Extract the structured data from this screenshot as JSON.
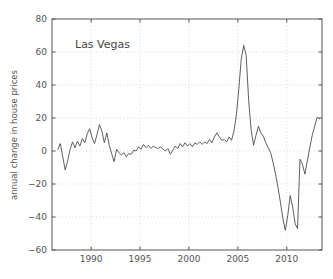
{
  "chart_data": {
    "type": "line",
    "title": "",
    "annotation": "Las Vegas",
    "xlabel": "",
    "ylabel": "annual change in house prices",
    "xlim": [
      1986.0,
      2013.6
    ],
    "ylim": [
      -60,
      80
    ],
    "xticks": [
      1990,
      1995,
      2000,
      2005,
      2010
    ],
    "xticklabels": [
      "1990",
      "1995",
      "2000",
      "2005",
      "2010"
    ],
    "yticks": [
      -60,
      -40,
      -20,
      0,
      20,
      40,
      60,
      80
    ],
    "yticklabels": [
      "-60",
      "-40",
      "-20",
      "0",
      "20",
      "40",
      "60",
      "80"
    ],
    "grid": true,
    "legend": "none",
    "line_color": "#4d4d4d",
    "series": [
      {
        "name": "Las Vegas annual change in house prices",
        "x": [
          1986.6,
          1986.85,
          1987.1,
          1987.35,
          1987.6,
          1987.85,
          1988.1,
          1988.35,
          1988.6,
          1988.85,
          1989.1,
          1989.35,
          1989.6,
          1989.85,
          1990.1,
          1990.35,
          1990.6,
          1990.85,
          1991.1,
          1991.35,
          1991.6,
          1991.85,
          1992.1,
          1992.35,
          1992.6,
          1992.85,
          1993.1,
          1993.35,
          1993.6,
          1993.85,
          1994.1,
          1994.35,
          1994.6,
          1994.85,
          1995.1,
          1995.35,
          1995.6,
          1995.85,
          1996.1,
          1996.35,
          1996.6,
          1996.85,
          1997.1,
          1997.35,
          1997.6,
          1997.85,
          1998.1,
          1998.35,
          1998.6,
          1998.85,
          1999.1,
          1999.35,
          1999.6,
          1999.85,
          2000.1,
          2000.35,
          2000.6,
          2000.85,
          2001.1,
          2001.35,
          2001.6,
          2001.85,
          2002.1,
          2002.35,
          2002.6,
          2002.85,
          2003.1,
          2003.35,
          2003.6,
          2003.85,
          2004.1,
          2004.35,
          2004.6,
          2004.85,
          2005.1,
          2005.35,
          2005.6,
          2005.85,
          2006.1,
          2006.35,
          2006.6,
          2006.85,
          2007.1,
          2007.35,
          2007.6,
          2007.85,
          2008.1,
          2008.35,
          2008.6,
          2008.85,
          2009.1,
          2009.35,
          2009.6,
          2009.85,
          2010.1,
          2010.35,
          2010.6,
          2010.85,
          2011.1,
          2011.35,
          2011.6,
          2011.85,
          2012.1,
          2012.35,
          2012.6,
          2012.85,
          2013.1,
          2013.35
        ],
        "y": [
          1.0,
          4.5,
          -3.5,
          -11.5,
          -6.0,
          1.0,
          5.5,
          2.0,
          6.0,
          3.0,
          7.5,
          5.0,
          10.5,
          13.5,
          8.0,
          4.5,
          10.0,
          16.0,
          12.0,
          5.0,
          11.0,
          3.5,
          -1.5,
          -6.5,
          1.0,
          -1.0,
          -2.5,
          -1.0,
          -3.5,
          -1.5,
          -2.0,
          0.5,
          0.0,
          2.5,
          1.0,
          4.0,
          2.0,
          3.5,
          1.5,
          3.0,
          2.0,
          1.5,
          2.5,
          1.0,
          0.0,
          1.5,
          -2.0,
          0.5,
          3.0,
          1.5,
          4.5,
          2.5,
          5.0,
          3.0,
          4.5,
          2.5,
          5.0,
          4.0,
          5.5,
          4.0,
          5.5,
          4.5,
          7.0,
          5.0,
          8.5,
          11.0,
          8.5,
          6.5,
          7.0,
          5.5,
          8.5,
          6.5,
          12.0,
          22.0,
          38.0,
          56.0,
          64.0,
          58.0,
          31.0,
          13.0,
          3.5,
          9.5,
          15.0,
          11.0,
          9.0,
          5.0,
          2.0,
          -1.0,
          -7.0,
          -14.0,
          -22.0,
          -31.0,
          -41.0,
          -48.0,
          -39.0,
          -27.0,
          -34.0,
          -44.0,
          -47.0,
          -36.0,
          -17.0,
          -5.0,
          -4.5,
          -4.0,
          -6.0,
          -4.5,
          -9.0,
          -5.5
        ]
      }
    ],
    "tail": {
      "x": [
        2011.35,
        2011.6,
        2011.85,
        2012.1,
        2012.35,
        2012.6,
        2012.85,
        2013.1,
        2013.35
      ],
      "y": [
        -5.0,
        -8.0,
        -14.0,
        -6.0,
        2.0,
        9.5,
        15.0,
        20.5,
        19.5
      ]
    }
  },
  "figure": {
    "background_color": "#ffffff",
    "axes_color": "#555555",
    "grid_color": "#cccccc"
  }
}
